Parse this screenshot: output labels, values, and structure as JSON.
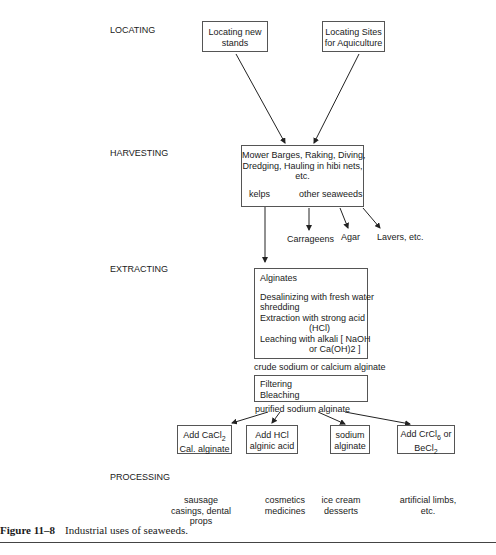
{
  "stages": {
    "locating": "LOCATING",
    "harvesting": "HARVESTING",
    "extracting": "EXTRACTING",
    "processing": "PROCESSING"
  },
  "locating": {
    "new_stands": [
      "Locating new",
      "stands"
    ],
    "aquaculture": [
      "Locating Sites",
      "for Aquiculture"
    ]
  },
  "harvesting": {
    "methods": [
      "Mower Barges, Raking, Diving,",
      "Dredging, Hauling in hibi nets,",
      "etc."
    ],
    "kelps": "kelps",
    "other": "other seaweeds",
    "products": {
      "carrageens": "Carrageens",
      "agar": "Agar",
      "lavers": "Lavers, etc."
    }
  },
  "extracting": {
    "title": "Alginates",
    "steps": [
      "Desalinizing with fresh water",
      "shredding",
      "Extraction with strong acid",
      "(HCl)",
      "Leaching with alkali  [ NaOH",
      "or Ca(OH)2 ]"
    ],
    "crude": "crude sodium or calcium alginate",
    "refine": [
      "Filtering",
      "Bleaching"
    ],
    "purified": "purified sodium alginate"
  },
  "products": [
    {
      "line1": "Add CaCl2",
      "line2": "Cal. alginate"
    },
    {
      "line1": "Add HCl",
      "line2": "alginic acid"
    },
    {
      "line1": "sodium",
      "line2": "alginate"
    },
    {
      "line1": "Add CrCl6 or",
      "line2": "BeCl2"
    }
  ],
  "uses": [
    [
      "sausage",
      "casings, dental",
      "props"
    ],
    [
      "cosmetics",
      "medicines"
    ],
    [
      "ice cream",
      "desserts"
    ],
    [
      "artificial limbs,",
      "etc."
    ]
  ],
  "caption": {
    "label": "Figure 11–8",
    "text": "Industrial uses of seaweeds."
  }
}
